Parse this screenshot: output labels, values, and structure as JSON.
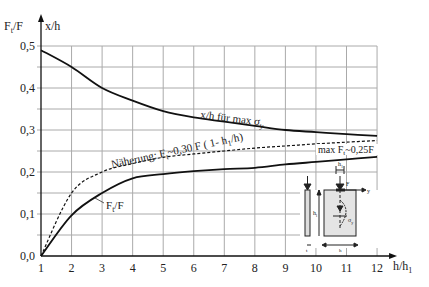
{
  "chart_data": {
    "type": "line",
    "title": "",
    "xlabel": "h/h1",
    "ylabel_left": "Ft/F",
    "ylabel_right": "x/h",
    "xlim": [
      1,
      12
    ],
    "ylim": [
      0,
      0.5
    ],
    "grid": true,
    "x_ticks": [
      "1",
      "2",
      "3",
      "4",
      "5",
      "6",
      "7",
      "8",
      "9",
      "10",
      "11",
      "12"
    ],
    "y_ticks": [
      "0,0",
      "0,1",
      "0,2",
      "0,3",
      "0,4",
      "0,5"
    ],
    "x": [
      1,
      2,
      3,
      4,
      5,
      6,
      7,
      8,
      9,
      10,
      11,
      12
    ],
    "series": [
      {
        "name": "x/h für max σy",
        "style": "solid",
        "values": [
          0.49,
          0.45,
          0.4,
          0.37,
          0.345,
          0.33,
          0.32,
          0.31,
          0.3,
          0.295,
          0.29,
          0.286
        ]
      },
      {
        "name": "Näherung: Ft~0,30 F (1- h1/h)",
        "style": "dashed",
        "values": [
          0.0,
          0.15,
          0.2,
          0.22,
          0.235,
          0.243,
          0.25,
          0.257,
          0.262,
          0.267,
          0.271,
          0.275
        ]
      },
      {
        "name": "Ft/F",
        "style": "solid",
        "values": [
          0.0,
          0.097,
          0.15,
          0.185,
          0.195,
          0.202,
          0.207,
          0.21,
          0.218,
          0.224,
          0.23,
          0.236
        ]
      }
    ],
    "annotations": [
      "x/h für max σy",
      "Näherung: Ft~0,30 F ( 1- h1/h)",
      "max Ft~0,25F",
      "Ft/F"
    ]
  },
  "labels": {
    "y_left_main": "F",
    "y_left_sub": "t",
    "y_left_rest": "/F",
    "y_right": "x/h",
    "x_axis_main": "h/h",
    "x_axis_sub": "1",
    "curve_xh_main": "x/h für max σ",
    "curve_xh_sub": "y",
    "approx_pre": "Näherung: F",
    "approx_sub": "t",
    "approx_post": "~0,30 F ( 1- h",
    "approx_sub2": "1",
    "approx_end": "/h)",
    "max_pre": "max F",
    "max_sub": "t",
    "max_post": "~0,25F",
    "ft_main": "F",
    "ft_sub": "t",
    "ft_post": "/F"
  },
  "inset": {
    "labels": {
      "h1": "h",
      "h1_sub": "1",
      "F": "F",
      "y": "y",
      "hl": "h",
      "hl_sub": "l",
      "t": "t",
      "h": "h",
      "sigma": "σ",
      "sigma_sub": "y"
    }
  }
}
